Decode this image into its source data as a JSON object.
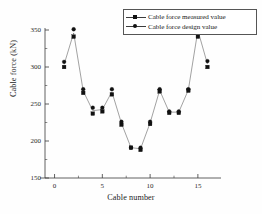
{
  "chart_data": {
    "type": "scatter",
    "title": "",
    "xlabel": "Cable number",
    "ylabel": "Cable force (kN)",
    "xlim": [
      -1,
      17
    ],
    "ylim": [
      150,
      350
    ],
    "xticks": [
      0,
      5,
      10,
      15
    ],
    "yticks": [
      150,
      200,
      250,
      300,
      350
    ],
    "xtick_labels": [
      "0",
      "5",
      "10",
      "15"
    ],
    "ytick_labels": [
      "150",
      "200",
      "250",
      "300",
      "350"
    ],
    "grid": false,
    "legend_position": "top-right",
    "x": [
      1,
      2,
      3,
      4,
      5,
      6,
      7,
      8,
      9,
      10,
      11,
      12,
      13,
      14,
      15,
      16
    ],
    "series": [
      {
        "name": "Cable force measured value",
        "marker": "square",
        "color": "#111111",
        "values": [
          300,
          341,
          265,
          237,
          240,
          263,
          222,
          191,
          188,
          223,
          267,
          238,
          238,
          268,
          341,
          300
        ]
      },
      {
        "name": "Cable force design value",
        "marker": "circle",
        "color": "#111111",
        "values": [
          307,
          351,
          270,
          245,
          245,
          270,
          226,
          191,
          191,
          226,
          270,
          240,
          240,
          270,
          358,
          308
        ]
      }
    ]
  },
  "legend": {
    "items": [
      {
        "label": "Cable force measured value",
        "marker": "square"
      },
      {
        "label": "Cable force design value",
        "marker": "circle"
      }
    ]
  },
  "axes": {
    "x_title": "Cable number",
    "y_title": "Cable force (kN)"
  }
}
